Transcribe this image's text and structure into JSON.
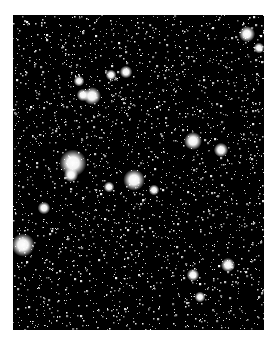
{
  "image": {
    "kind": "star-field",
    "background_color": "#000000",
    "page_color": "#ffffff",
    "frame": {
      "x": 13,
      "y": 15,
      "width": 251,
      "height": 315
    },
    "faint_star_count": 2600,
    "bright_stars": [
      {
        "x": 60,
        "y": 148,
        "r": 7.5
      },
      {
        "x": 58,
        "y": 160,
        "r": 4
      },
      {
        "x": 121,
        "y": 165,
        "r": 6
      },
      {
        "x": 10,
        "y": 230,
        "r": 6.5
      },
      {
        "x": 79,
        "y": 81,
        "r": 5
      },
      {
        "x": 180,
        "y": 126,
        "r": 5
      },
      {
        "x": 70,
        "y": 80,
        "r": 3.5
      },
      {
        "x": 208,
        "y": 135,
        "r": 4
      },
      {
        "x": 234,
        "y": 19,
        "r": 4.5
      },
      {
        "x": 215,
        "y": 250,
        "r": 4
      },
      {
        "x": 31,
        "y": 193,
        "r": 3.5
      },
      {
        "x": 113,
        "y": 57,
        "r": 3.5
      },
      {
        "x": 98,
        "y": 60,
        "r": 3
      },
      {
        "x": 180,
        "y": 260,
        "r": 3.5
      },
      {
        "x": 187,
        "y": 282,
        "r": 3
      },
      {
        "x": 246,
        "y": 33,
        "r": 3
      },
      {
        "x": 141,
        "y": 175,
        "r": 3
      },
      {
        "x": 66,
        "y": 66,
        "r": 3
      },
      {
        "x": 96,
        "y": 172,
        "r": 3
      }
    ]
  }
}
